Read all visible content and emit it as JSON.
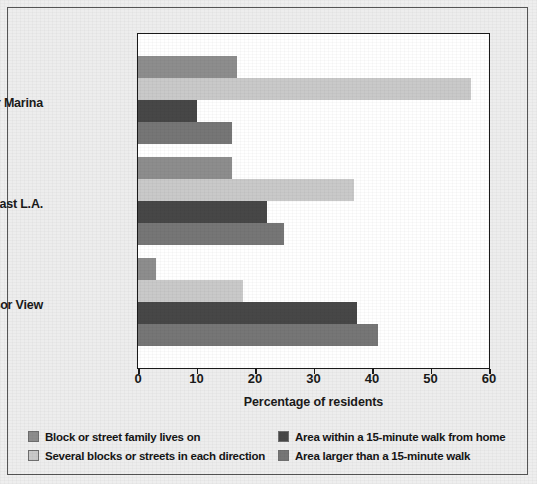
{
  "chart_data": {
    "type": "bar",
    "orientation": "horizontal",
    "title": "",
    "xlabel": "Percentage of residents",
    "ylabel": "",
    "categories": [
      "Culver Marina",
      "East L.A.",
      "Windsor View"
    ],
    "xlim": [
      0,
      60
    ],
    "xticks": [
      0,
      10,
      20,
      30,
      40,
      50,
      60
    ],
    "xtick_labels": [
      "0",
      "10",
      "20",
      "30",
      "40",
      "50",
      "60"
    ],
    "grid": false,
    "legend_position": "bottom",
    "series": [
      {
        "name": "Block or street family lives on",
        "color": "#8d8d8d",
        "values": [
          17,
          16,
          3
        ]
      },
      {
        "name": "Several blocks or streets in each direction",
        "color": "#c9c9c9",
        "values": [
          57,
          37,
          18
        ]
      },
      {
        "name": "Area within a 15-minute walk from home",
        "color": "#474747",
        "values": [
          10,
          22,
          37.5
        ]
      },
      {
        "name": "Area larger than a 15-minute walk",
        "color": "#767676",
        "values": [
          16,
          25,
          41
        ]
      }
    ]
  },
  "axis": {
    "x_title": "Percentage of residents",
    "tick_labels": [
      "0",
      "10",
      "20",
      "30",
      "40",
      "50",
      "60"
    ]
  },
  "categories": [
    {
      "label": "Culver Marina"
    },
    {
      "label": "East L.A."
    },
    {
      "label": "Windsor View"
    }
  ],
  "legend": {
    "items": [
      {
        "label": "Block or street family lives on",
        "color": "#8d8d8d"
      },
      {
        "label": "Area within a 15-minute walk from home",
        "color": "#474747"
      },
      {
        "label": "Several blocks or streets in each direction",
        "color": "#c9c9c9"
      },
      {
        "label": "Area larger than a 15-minute walk",
        "color": "#767676"
      }
    ]
  },
  "colors": {
    "background": "#ededed",
    "plot_background": "#ffffff",
    "frame": "#1a1a1a",
    "text": "#1a1a1a"
  }
}
